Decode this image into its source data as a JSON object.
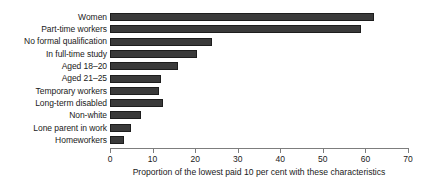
{
  "chart_data": {
    "type": "bar",
    "orientation": "horizontal",
    "title": "",
    "xlabel": "Proportion of the lowest paid 10 per cent with these characteristics",
    "ylabel": "",
    "xlim": [
      0,
      70
    ],
    "xticks": [
      0,
      10,
      20,
      30,
      40,
      50,
      60,
      70
    ],
    "xtick_labels": [
      "0",
      "10",
      "20",
      "30",
      "40",
      "50",
      "60",
      "70"
    ],
    "grid": false,
    "legend": false,
    "bar_color": "#3a3a3a",
    "bar_edge_color": "#1d1d1d",
    "axis_color": "#7d7d7d",
    "categories": [
      "Women",
      "Part-time workers",
      "No formal qualification",
      "In full-time study",
      "Aged 18–20",
      "Aged 21–25",
      "Temporary workers",
      "Long-term disabled",
      "Non-white",
      "Lone parent in work",
      "Homeworkers"
    ],
    "values": [
      62,
      59,
      24,
      20.5,
      16,
      12,
      11.5,
      12.5,
      7.3,
      4.9,
      3.3
    ]
  }
}
